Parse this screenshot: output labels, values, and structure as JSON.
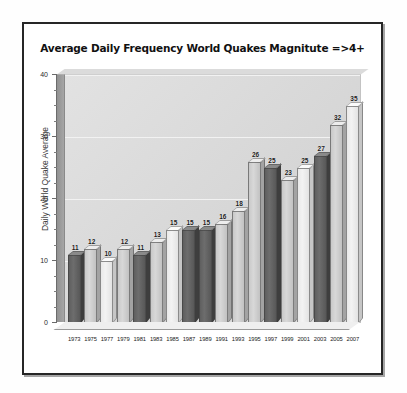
{
  "chart_data": {
    "type": "bar",
    "title": "Average Daily Frequency World Quakes Magnitute =>4+",
    "xlabel": "",
    "ylabel": "Daily World Quake Average",
    "ylim": [
      0,
      40
    ],
    "yticks": [
      0,
      10,
      20,
      30,
      40
    ],
    "ytick_labels": [
      "0",
      "10",
      "20",
      "30",
      "40"
    ],
    "grid": true,
    "legend": "none",
    "categories": [
      "1973",
      "1975",
      "1977",
      "1979",
      "1981",
      "1983",
      "1985",
      "1987",
      "1989",
      "1991",
      "1993",
      "1995",
      "1997",
      "1999",
      "2001",
      "2003",
      "2005",
      "2007"
    ],
    "values": [
      11,
      12,
      10,
      12,
      11,
      13,
      15,
      15,
      15,
      16,
      18,
      26,
      25,
      23,
      25,
      27,
      32,
      35
    ],
    "data_labels": [
      "11",
      "12",
      "10",
      "12",
      "11",
      "13",
      "15",
      "15",
      "15",
      "16",
      "18",
      "26",
      "25",
      "23",
      "25",
      "27",
      "32",
      "35"
    ],
    "bar_styles": [
      "dark",
      "light",
      "pale",
      "light",
      "dark",
      "light",
      "pale",
      "dark",
      "dark",
      "light",
      "light",
      "light",
      "dark",
      "light",
      "pale",
      "dark",
      "light",
      "pale"
    ],
    "colors": {
      "bar_dark": "#5f5f5f",
      "bar_light": "#c9c9c9",
      "bar_pale": "#e9e9e9",
      "plot_background": "#dcdcdc",
      "page_background": "#ffffff",
      "frame_border": "#262626",
      "axis": "#6b6b6b",
      "text": "#1a1a1a"
    }
  }
}
